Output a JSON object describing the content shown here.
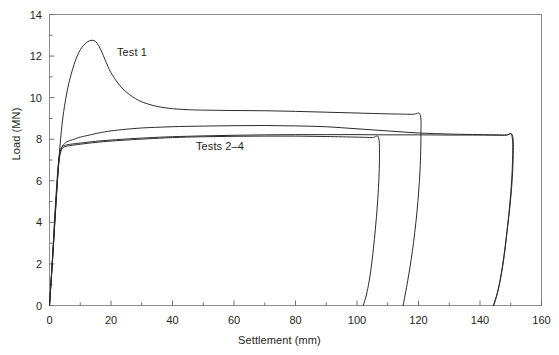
{
  "chart_data": {
    "type": "line",
    "title": "",
    "xlabel": "Settlement (mm)",
    "ylabel": "Load (MN)",
    "xlim": [
      0,
      160
    ],
    "ylim": [
      0,
      14
    ],
    "xticks": [
      0,
      20,
      40,
      60,
      80,
      100,
      120,
      140,
      160
    ],
    "xtick_labels": [
      "0",
      "20",
      "40",
      "60",
      "80",
      "100",
      "120",
      "140",
      "160"
    ],
    "xminor_step": 10,
    "yticks": [
      0,
      2,
      4,
      6,
      8,
      10,
      12,
      14
    ],
    "ytick_labels": [
      "0",
      "2",
      "4",
      "6",
      "8",
      "10",
      "12",
      "14"
    ],
    "yminor_step": 1,
    "grid": false,
    "legend_position": "inline-annotations",
    "annotations": [
      {
        "text": "Test 1",
        "x": 22.5,
        "y": 12.1
      },
      {
        "text": "Tests 2–4",
        "x": 48.5,
        "y": 7.45
      }
    ],
    "series": [
      {
        "name": "Test 1",
        "color": "#2b2b2b",
        "width": 1.0,
        "points": [
          [
            0.0,
            0.0
          ],
          [
            1.0,
            2.2
          ],
          [
            2.0,
            4.6
          ],
          [
            3.0,
            6.9
          ],
          [
            4.0,
            8.6
          ],
          [
            5.0,
            9.7
          ],
          [
            6.0,
            10.5
          ],
          [
            7.0,
            11.1
          ],
          [
            8.0,
            11.6
          ],
          [
            9.0,
            12.0
          ],
          [
            10.0,
            12.3
          ],
          [
            11.0,
            12.5
          ],
          [
            12.0,
            12.65
          ],
          [
            13.0,
            12.73
          ],
          [
            14.0,
            12.76
          ],
          [
            15.0,
            12.7
          ],
          [
            16.0,
            12.5
          ],
          [
            17.0,
            12.2
          ],
          [
            18.0,
            11.85
          ],
          [
            19.0,
            11.5
          ],
          [
            20.0,
            11.2
          ],
          [
            22.0,
            10.75
          ],
          [
            24.0,
            10.4
          ],
          [
            26.0,
            10.15
          ],
          [
            28.0,
            9.95
          ],
          [
            30.0,
            9.8
          ],
          [
            33.0,
            9.65
          ],
          [
            36.0,
            9.55
          ],
          [
            40.0,
            9.47
          ],
          [
            45.0,
            9.42
          ],
          [
            50.0,
            9.4
          ],
          [
            60.0,
            9.38
          ],
          [
            70.0,
            9.37
          ],
          [
            80.0,
            9.34
          ],
          [
            90.0,
            9.3
          ],
          [
            100.0,
            9.26
          ],
          [
            110.0,
            9.22
          ],
          [
            118.0,
            9.2
          ],
          [
            120.5,
            9.2
          ],
          [
            120.8,
            8.3
          ],
          [
            120.5,
            6.5
          ],
          [
            119.5,
            4.5
          ],
          [
            118.0,
            2.6
          ],
          [
            116.5,
            1.2
          ],
          [
            115.0,
            0.0
          ]
        ]
      },
      {
        "name": "Test 2",
        "color": "#2b2b2b",
        "width": 1.0,
        "points": [
          [
            0.0,
            0.0
          ],
          [
            1.0,
            2.4
          ],
          [
            2.0,
            5.0
          ],
          [
            3.0,
            7.0
          ],
          [
            4.0,
            7.6
          ],
          [
            5.0,
            7.8
          ],
          [
            6.0,
            7.9
          ],
          [
            8.0,
            8.0
          ],
          [
            10.0,
            8.1
          ],
          [
            13.0,
            8.2
          ],
          [
            16.0,
            8.3
          ],
          [
            20.0,
            8.4
          ],
          [
            25.0,
            8.48
          ],
          [
            30.0,
            8.54
          ],
          [
            36.0,
            8.58
          ],
          [
            42.0,
            8.61
          ],
          [
            50.0,
            8.63
          ],
          [
            60.0,
            8.65
          ],
          [
            70.0,
            8.66
          ],
          [
            80.0,
            8.64
          ],
          [
            90.0,
            8.6
          ],
          [
            100.0,
            8.5
          ],
          [
            110.0,
            8.4
          ],
          [
            120.0,
            8.3
          ],
          [
            130.0,
            8.25
          ],
          [
            140.0,
            8.22
          ],
          [
            148.0,
            8.2
          ],
          [
            150.5,
            8.2
          ],
          [
            150.8,
            7.2
          ],
          [
            150.2,
            5.5
          ],
          [
            149.0,
            3.8
          ],
          [
            147.5,
            2.0
          ],
          [
            146.0,
            0.8
          ],
          [
            144.5,
            0.0
          ]
        ]
      },
      {
        "name": "Test 3",
        "color": "#2b2b2b",
        "width": 1.0,
        "points": [
          [
            0.0,
            0.0
          ],
          [
            1.0,
            2.3
          ],
          [
            2.0,
            4.8
          ],
          [
            3.0,
            6.9
          ],
          [
            3.6,
            7.5
          ],
          [
            4.2,
            7.65
          ],
          [
            5.0,
            7.7
          ],
          [
            6.0,
            7.74
          ],
          [
            8.0,
            7.78
          ],
          [
            11.0,
            7.83
          ],
          [
            15.0,
            7.9
          ],
          [
            20.0,
            7.96
          ],
          [
            26.0,
            8.02
          ],
          [
            32.0,
            8.07
          ],
          [
            40.0,
            8.12
          ],
          [
            50.0,
            8.16
          ],
          [
            60.0,
            8.19
          ],
          [
            70.0,
            8.21
          ],
          [
            80.0,
            8.22
          ],
          [
            90.0,
            8.22
          ],
          [
            100.0,
            8.22
          ],
          [
            110.0,
            8.21
          ],
          [
            120.0,
            8.21
          ],
          [
            130.0,
            8.2
          ],
          [
            140.0,
            8.2
          ],
          [
            148.0,
            8.19
          ],
          [
            150.3,
            8.19
          ],
          [
            150.6,
            7.1
          ],
          [
            150.0,
            5.4
          ],
          [
            148.8,
            3.6
          ],
          [
            147.3,
            1.9
          ],
          [
            145.8,
            0.7
          ],
          [
            144.3,
            0.0
          ]
        ]
      },
      {
        "name": "Test 4",
        "color": "#2b2b2b",
        "width": 1.0,
        "points": [
          [
            0.0,
            0.0
          ],
          [
            1.0,
            2.25
          ],
          [
            2.0,
            4.7
          ],
          [
            3.0,
            6.8
          ],
          [
            3.8,
            7.45
          ],
          [
            4.5,
            7.6
          ],
          [
            5.5,
            7.66
          ],
          [
            7.0,
            7.7
          ],
          [
            10.0,
            7.76
          ],
          [
            14.0,
            7.83
          ],
          [
            19.0,
            7.9
          ],
          [
            25.0,
            7.96
          ],
          [
            32.0,
            8.02
          ],
          [
            40.0,
            8.08
          ],
          [
            50.0,
            8.12
          ],
          [
            60.0,
            8.14
          ],
          [
            70.0,
            8.15
          ],
          [
            80.0,
            8.15
          ],
          [
            90.0,
            8.13
          ],
          [
            100.0,
            8.1
          ],
          [
            105.0,
            8.08
          ],
          [
            107.0,
            8.08
          ],
          [
            107.3,
            7.0
          ],
          [
            106.8,
            5.2
          ],
          [
            105.8,
            3.4
          ],
          [
            104.5,
            1.7
          ],
          [
            103.2,
            0.6
          ],
          [
            102.0,
            0.0
          ]
        ]
      }
    ]
  },
  "axis": {
    "x_title": "Settlement (mm)",
    "y_title": "Load (MN)"
  }
}
